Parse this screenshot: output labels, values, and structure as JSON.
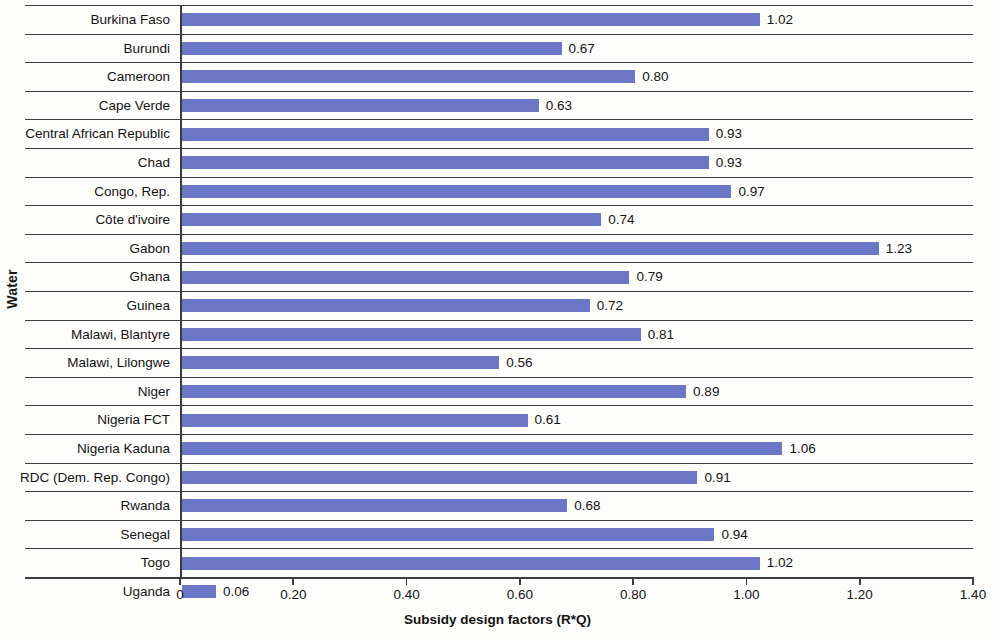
{
  "chart_data": {
    "type": "bar",
    "orientation": "horizontal",
    "title": "",
    "xlabel": "Subsidy design factors (R*Q)",
    "ylabel": "Water",
    "xlim": [
      0,
      1.4
    ],
    "xticks": [
      "0",
      "0.20",
      "0.40",
      "0.60",
      "0.80",
      "1.00",
      "1.20",
      "1.40"
    ],
    "xtick_values": [
      0,
      0.2,
      0.4,
      0.6,
      0.8,
      1.0,
      1.2,
      1.4
    ],
    "grid": false,
    "legend": "none",
    "bar_color": "#6b77c6",
    "categories": [
      "Burkina Faso",
      "Burundi",
      "Cameroon",
      "Cape Verde",
      "Central African Republic",
      "Chad",
      "Congo, Rep.",
      "Côte d'ivoire",
      "Gabon",
      "Ghana",
      "Guinea",
      "Malawi, Blantyre",
      "Malawi, Lilongwe",
      "Niger",
      "Nigeria  FCT",
      "Nigeria Kaduna",
      "RDC (Dem. Rep. Congo)",
      "Rwanda",
      "Senegal",
      "Togo",
      "Uganda"
    ],
    "values": [
      1.02,
      0.67,
      0.8,
      0.63,
      0.93,
      0.93,
      0.97,
      0.74,
      1.23,
      0.79,
      0.72,
      0.81,
      0.56,
      0.89,
      0.61,
      1.06,
      0.91,
      0.68,
      0.94,
      1.02,
      0.06
    ],
    "value_labels": [
      "1.02",
      "0.67",
      "0.80",
      "0.63",
      "0.93",
      "0.93",
      "0.97",
      "0.74",
      "1.23",
      "0.79",
      "0.72",
      "0.81",
      "0.56",
      "0.89",
      "0.61",
      "1.06",
      "0.91",
      "0.68",
      "0.94",
      "1.02",
      "0.06"
    ]
  }
}
